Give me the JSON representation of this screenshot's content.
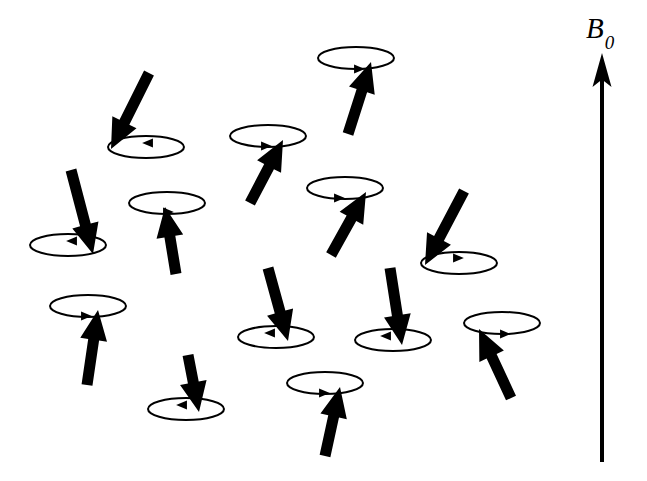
{
  "figure": {
    "kind": "physics-diagram",
    "title_text": "",
    "width": 647,
    "height": 481,
    "background_color": "#ffffff",
    "ink_color": "#000000"
  },
  "field": {
    "label_symbol": "B",
    "label_subscript": "0",
    "label_x": 586,
    "label_y": 14,
    "arrow": {
      "name": "b0-field-arrow",
      "x": 602,
      "y_tail": 462,
      "y_tip": 53,
      "shaft_width": 4,
      "head_width": 19,
      "head_length": 34,
      "direction": "up"
    }
  },
  "precession": {
    "ellipse_rx": 38,
    "ellipse_ry": 11,
    "ellipse_stroke_width": 2,
    "rim_marker_size": 9,
    "spin_shaft_width": 11,
    "spin_head_width": 27,
    "spin_head_length": 30,
    "count": 16
  },
  "spins": [
    {
      "id": "spin-1",
      "label": "top-center-up",
      "ellipse_cx": 356,
      "ellipse_cy": 58,
      "tip_x": 371,
      "tip_y": 62,
      "tail_x": 348,
      "tail_y": 134,
      "orientation": "up",
      "rim_marker_direction": "right",
      "rim_marker_x": 359,
      "rim_marker_y": 69
    },
    {
      "id": "spin-2",
      "label": "upper-left-down",
      "ellipse_cx": 146,
      "ellipse_cy": 147,
      "tip_x": 111,
      "tip_y": 149,
      "tail_x": 149,
      "tail_y": 73,
      "orientation": "down",
      "rim_marker_direction": "left",
      "rim_marker_x": 148,
      "rim_marker_y": 143
    },
    {
      "id": "spin-3",
      "label": "upper-mid-up",
      "ellipse_cx": 268,
      "ellipse_cy": 136,
      "tip_x": 283,
      "tip_y": 140,
      "tail_x": 250,
      "tail_y": 203,
      "orientation": "up",
      "rim_marker_direction": "right",
      "rim_marker_x": 266,
      "rim_marker_y": 146
    },
    {
      "id": "spin-4",
      "label": "mid-right-up",
      "ellipse_cx": 345,
      "ellipse_cy": 188,
      "tip_x": 366,
      "tip_y": 192,
      "tail_x": 331,
      "tail_y": 255,
      "orientation": "up",
      "rim_marker_direction": "right",
      "rim_marker_x": 339,
      "rim_marker_y": 198
    },
    {
      "id": "spin-5",
      "label": "left-edge-down",
      "ellipse_cx": 68,
      "ellipse_cy": 245,
      "tip_x": 93,
      "tip_y": 254,
      "tail_x": 71,
      "tail_y": 170,
      "orientation": "down",
      "rim_marker_direction": "left",
      "rim_marker_x": 72,
      "rim_marker_y": 241
    },
    {
      "id": "spin-6",
      "label": "left-mid-up",
      "ellipse_cx": 167,
      "ellipse_cy": 203,
      "tip_x": 165,
      "tip_y": 207,
      "tail_x": 176,
      "tail_y": 274,
      "orientation": "up",
      "rim_marker_direction": "right",
      "rim_marker_x": 168,
      "rim_marker_y": 212
    },
    {
      "id": "spin-7",
      "label": "right-upper-down",
      "ellipse_cx": 459,
      "ellipse_cy": 263,
      "tip_x": 425,
      "tip_y": 265,
      "tail_x": 464,
      "tail_y": 191,
      "orientation": "down",
      "rim_marker_direction": "right",
      "rim_marker_x": 458,
      "rim_marker_y": 258
    },
    {
      "id": "spin-8",
      "label": "left-lower-up",
      "ellipse_cx": 88,
      "ellipse_cy": 306,
      "tip_x": 98,
      "tip_y": 310,
      "tail_x": 87,
      "tail_y": 385,
      "orientation": "up",
      "rim_marker_direction": "right",
      "rim_marker_x": 86,
      "rim_marker_y": 316
    },
    {
      "id": "spin-9",
      "label": "center-down",
      "ellipse_cx": 276,
      "ellipse_cy": 337,
      "tip_x": 288,
      "tip_y": 341,
      "tail_x": 268,
      "tail_y": 268,
      "orientation": "down",
      "rim_marker_direction": "left",
      "rim_marker_x": 270,
      "rim_marker_y": 333
    },
    {
      "id": "spin-10",
      "label": "center-right-down",
      "ellipse_cx": 393,
      "ellipse_cy": 340,
      "tip_x": 402,
      "tip_y": 345,
      "tail_x": 390,
      "tail_y": 268,
      "orientation": "down",
      "rim_marker_direction": "left",
      "rim_marker_x": 386,
      "rim_marker_y": 336
    },
    {
      "id": "spin-11",
      "label": "far-right-up",
      "ellipse_cx": 502,
      "ellipse_cy": 323,
      "tip_x": 479,
      "tip_y": 329,
      "tail_x": 511,
      "tail_y": 398,
      "orientation": "up",
      "rim_marker_direction": "right",
      "rim_marker_x": 505,
      "rim_marker_y": 334
    },
    {
      "id": "spin-12",
      "label": "bottom-left-down",
      "ellipse_cx": 186,
      "ellipse_cy": 409,
      "tip_x": 199,
      "tip_y": 412,
      "tail_x": 188,
      "tail_y": 355,
      "orientation": "down",
      "rim_marker_direction": "left",
      "rim_marker_x": 182,
      "rim_marker_y": 405
    },
    {
      "id": "spin-13",
      "label": "bottom-center-up",
      "ellipse_cx": 325,
      "ellipse_cy": 383,
      "tip_x": 340,
      "tip_y": 387,
      "tail_x": 325,
      "tail_y": 456,
      "orientation": "up",
      "rim_marker_direction": "right",
      "rim_marker_x": 324,
      "rim_marker_y": 393
    },
    {
      "id": "spin-14",
      "label": "upper-right-down-small",
      "ellipse_cx": 441,
      "ellipse_cy": 266,
      "tip_x": 441,
      "tip_y": 266,
      "tail_x": 441,
      "tail_y": 266,
      "orientation": "hidden",
      "rim_marker_direction": "none",
      "rim_marker_x": 441,
      "rim_marker_y": 266
    }
  ],
  "colors": {
    "ink": "#000000",
    "paper": "#ffffff"
  }
}
